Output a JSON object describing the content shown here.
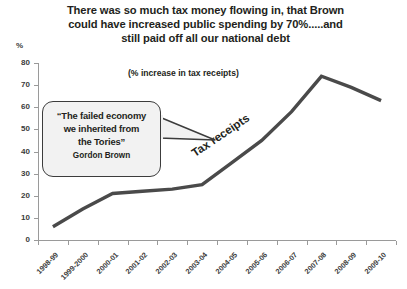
{
  "title": {
    "lines": [
      "There was so much tax money flowing in, that Brown",
      "could have increased public spending by 70%.....and",
      "still paid off all our national debt"
    ]
  },
  "axis_unit_label": "%",
  "subtitle_note": "(% increase in tax receipts)",
  "series_label": "Tax receipts",
  "callout": {
    "quote_lines": [
      "“The failed economy",
      "we inherited from",
      "the Tories”"
    ],
    "attribution": "Gordon Brown"
  },
  "colors": {
    "line": "#4a4a4a",
    "axis": "#9a9a9a",
    "text": "#231f20",
    "callout_fill": "#f2f2f2",
    "callout_border": "#3c3c3c",
    "background": "#ffffff"
  },
  "chart_data": {
    "type": "line",
    "title": "There was so much tax money flowing in, that Brown could have increased public spending by 70%.....and still paid off all our national debt",
    "subtitle": "(% increase in tax receipts)",
    "xlabel": "",
    "ylabel": "%",
    "ylim": [
      0,
      80
    ],
    "yticks": [
      0,
      10,
      20,
      30,
      40,
      50,
      60,
      70,
      80
    ],
    "ytick_labels": [
      "0",
      "10",
      "20",
      "30",
      "40",
      "50",
      "60",
      "70",
      "80"
    ],
    "grid": false,
    "legend": "none",
    "categories": [
      "1998-99",
      "1999-2000",
      "2000-01",
      "2001-02",
      "2002-03",
      "2003-04",
      "2004-05",
      "2005-06",
      "2006-07",
      "2007-08",
      "2008-09",
      "2009-10"
    ],
    "series": [
      {
        "name": "Tax receipts",
        "values": [
          6,
          14,
          21,
          22,
          23,
          25,
          35,
          45,
          58,
          74,
          69,
          63
        ]
      }
    ],
    "annotations": [
      {
        "text": "“The failed economy we inherited from the Tories” Gordon Brown",
        "type": "speech-bubble",
        "points_to": "2004-05"
      },
      {
        "text": "Tax receipts",
        "type": "inline-series-label"
      },
      {
        "text": "(% increase in tax receipts)",
        "type": "subtitle"
      }
    ]
  }
}
